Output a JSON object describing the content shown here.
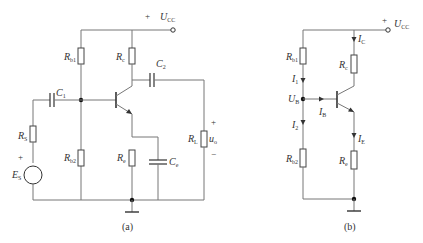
{
  "figure_a": {
    "caption": "(a)",
    "supply": {
      "sign": "+",
      "label": "U",
      "sub": "CC"
    },
    "labels": {
      "Rb1": {
        "main": "R",
        "sub": "b1"
      },
      "Rc": {
        "main": "R",
        "sub": "c"
      },
      "C1": {
        "main": "C",
        "sub": "1"
      },
      "C2": {
        "main": "C",
        "sub": "2"
      },
      "Rs": {
        "main": "R",
        "sub": "S"
      },
      "Es": {
        "main": "E",
        "sub": "S"
      },
      "Rb2": {
        "main": "R",
        "sub": "b2"
      },
      "Re": {
        "main": "R",
        "sub": "e"
      },
      "Ce": {
        "main": "C",
        "sub": "e"
      },
      "RL": {
        "main": "R",
        "sub": "L"
      },
      "uo": {
        "main": "u",
        "sub": "o"
      }
    },
    "signs": {
      "es_plus": "+",
      "uo_plus": "+",
      "uo_minus": "−"
    }
  },
  "figure_b": {
    "caption": "(b)",
    "supply": {
      "sign": "+",
      "label": "U",
      "sub": "CC"
    },
    "labels": {
      "Rb1": {
        "main": "R",
        "sub": "b1"
      },
      "Rc": {
        "main": "R",
        "sub": "c"
      },
      "Rb2": {
        "main": "R",
        "sub": "b2"
      },
      "Re": {
        "main": "R",
        "sub": "e"
      },
      "I1": {
        "main": "I",
        "sub": "1"
      },
      "I2": {
        "main": "I",
        "sub": "2"
      },
      "IB": {
        "main": "I",
        "sub": "B"
      },
      "IC": {
        "main": "I",
        "sub": "C"
      },
      "IE": {
        "main": "I",
        "sub": "E"
      },
      "UB": {
        "main": "U",
        "sub": "B"
      }
    }
  }
}
